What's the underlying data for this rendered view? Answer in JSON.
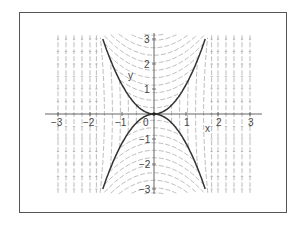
{
  "chart_data": {
    "type": "line",
    "subtype": "direction-field",
    "title": "",
    "xlabel": "x",
    "ylabel": "y",
    "xlim": [
      -3.1,
      3.2
    ],
    "ylim": [
      -3.1,
      3.2
    ],
    "grid": false,
    "legend": null,
    "x_ticks": [
      -3,
      -2,
      -1,
      0,
      1,
      2,
      3
    ],
    "y_ticks": [
      -3,
      -2,
      -1,
      1,
      2,
      3
    ],
    "x_tick_labels": [
      "−3",
      "−2",
      "−1",
      "0",
      "1",
      "2",
      "3"
    ],
    "y_tick_labels": [
      "−3",
      "−2",
      "−1",
      "1",
      "2",
      "3"
    ],
    "series": [
      {
        "name": "upper separatrix",
        "equation": "y = 1.17 x^2",
        "style": "bold",
        "x": [
          -1.6,
          -1.2,
          -0.8,
          -0.4,
          0,
          0.4,
          0.8,
          1.2,
          1.6
        ],
        "y": [
          3.0,
          1.68,
          0.75,
          0.19,
          0,
          0.19,
          0.75,
          1.68,
          3.0
        ]
      },
      {
        "name": "lower separatrix",
        "equation": "y = -1.17 x^2",
        "style": "bold",
        "x": [
          -1.6,
          -1.2,
          -0.8,
          -0.4,
          0,
          0.4,
          0.8,
          1.2,
          1.6
        ],
        "y": [
          -3.0,
          -1.68,
          -0.75,
          -0.19,
          0,
          -0.19,
          -0.75,
          -1.68,
          -3.0
        ]
      }
    ],
    "field": {
      "inner_curvature": 0.45,
      "inner_levels": [
        0.25,
        0.55,
        0.85,
        1.15,
        1.45,
        1.75,
        2.05,
        2.35,
        2.65,
        2.95,
        3.15
      ],
      "outer_columns": [
        -3.0,
        -2.75,
        -2.5,
        -2.25,
        -2.0,
        -1.8,
        1.8,
        2.0,
        2.25,
        2.5,
        2.75,
        3.0
      ],
      "side_levels": [
        -0.9,
        -0.6,
        -0.3,
        0.0,
        0.3,
        0.6,
        0.9
      ],
      "color": "#9a9a9a"
    }
  },
  "labels": {
    "x_axis": "x",
    "y_axis": "y",
    "origin": "0"
  },
  "colors": {
    "curve": "#333333",
    "axis": "#555555",
    "field": "#a0a0a0",
    "frame": "#555555"
  }
}
